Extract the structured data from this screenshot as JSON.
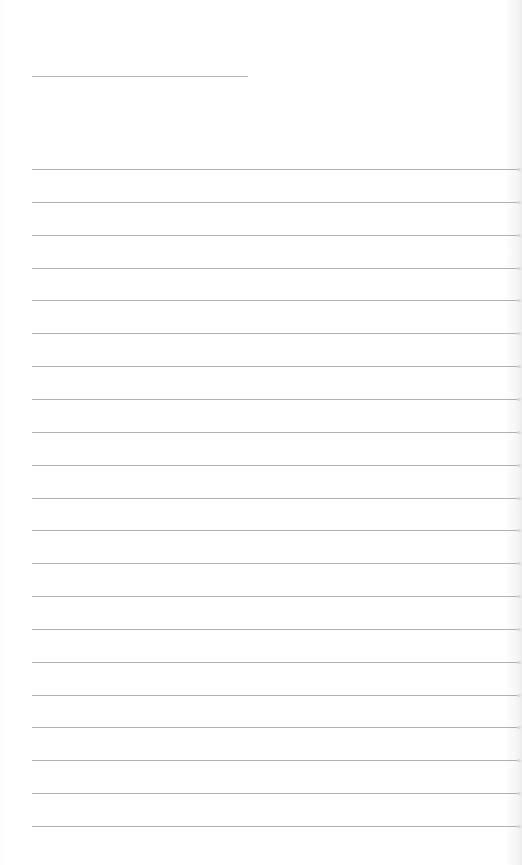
{
  "document": {
    "type": "lined-paper",
    "title_line": {
      "x": 32,
      "y": 76,
      "width": 216
    },
    "rules": {
      "start_y": 169,
      "spacing": 32.85,
      "count": 21,
      "x": 32,
      "width": 486
    },
    "colors": {
      "background": "#ffffff",
      "rule": "#b0b0b0"
    }
  }
}
